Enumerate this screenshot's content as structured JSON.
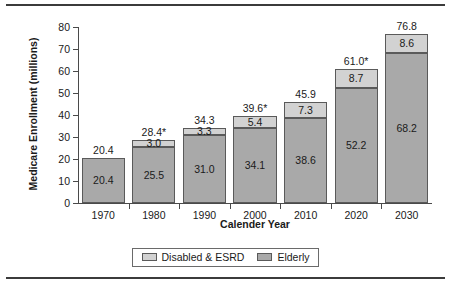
{
  "chart_data": {
    "type": "bar",
    "stacked": true,
    "title": "",
    "xlabel": "Calender Year",
    "ylabel": "Medicare Enrollment (millions)",
    "categories": [
      "1970",
      "1980",
      "1990",
      "2000",
      "2010",
      "2020",
      "2030"
    ],
    "ylim": [
      0,
      80
    ],
    "yticks": [
      0,
      10,
      20,
      30,
      40,
      50,
      60,
      70,
      80
    ],
    "ytick_labels": [
      "0",
      "10",
      "20",
      "30",
      "40",
      "50",
      "60",
      "70",
      "80"
    ],
    "grid": false,
    "legend_position": "bottom",
    "series": [
      {
        "name": "Elderly",
        "color": "#a9a9a9",
        "values": [
          20.4,
          25.5,
          31.0,
          34.1,
          38.6,
          52.2,
          68.2
        ],
        "labels": [
          "20.4",
          "25.5",
          "31.0",
          "34.1",
          "38.6",
          "52.2",
          "68.2"
        ]
      },
      {
        "name": "Disabled & ESRD",
        "color": "#d2d2d2",
        "values": [
          0.0,
          3.0,
          3.3,
          5.4,
          7.3,
          8.7,
          8.6
        ],
        "labels": [
          "",
          "3.0",
          "3.3",
          "5.4",
          "7.3",
          "8.7",
          "8.6"
        ]
      }
    ],
    "totals": [
      20.4,
      28.4,
      34.3,
      39.6,
      45.9,
      61.0,
      76.8
    ],
    "total_labels": [
      "20.4",
      "28.4*",
      "34.3",
      "39.6*",
      "45.9",
      "61.0*",
      "76.8"
    ]
  },
  "legend": {
    "items": [
      {
        "label": "Disabled & ESRD",
        "color": "#d2d2d2"
      },
      {
        "label": "Elderly",
        "color": "#a9a9a9"
      }
    ]
  },
  "colors": {
    "elderly": "#a9a9a9",
    "disabled_esrd": "#d2d2d2",
    "axis": "#4a4a4a",
    "rule": "#3b3b3b",
    "text": "#1a1a1a"
  }
}
